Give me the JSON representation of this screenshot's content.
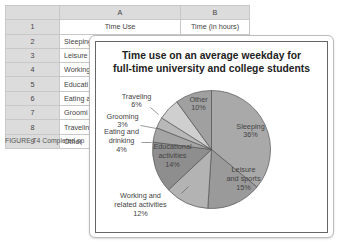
{
  "spreadsheet": {
    "column_headers": [
      "A",
      "B"
    ],
    "rows": [
      {
        "num": "1",
        "a": "Time Use",
        "b": "Time (in hours)"
      },
      {
        "num": "2",
        "a": "Sleeping",
        "b": "8.6"
      },
      {
        "num": "3",
        "a": "Leisure",
        "b": ""
      },
      {
        "num": "4",
        "a": "Working",
        "b": ""
      },
      {
        "num": "5",
        "a": "Educati",
        "b": ""
      },
      {
        "num": "6",
        "a": "Eating a",
        "b": ""
      },
      {
        "num": "7",
        "a": "Groomi",
        "b": ""
      },
      {
        "num": "8",
        "a": "Travelin",
        "b": ""
      },
      {
        "num": "9",
        "a": "Other",
        "b": ""
      }
    ]
  },
  "caption": "FIGURE T4 Completed sp",
  "chart_data": {
    "type": "pie",
    "title": "Time use on an average weekday for full-time university and college students",
    "title_lines": [
      "Time use on an average weekday for",
      "full-time university and college students"
    ],
    "categories": [
      "Sleeping",
      "Leisure and sports",
      "Working and related activities",
      "Educational activities",
      "Eating and drinking",
      "Grooming",
      "Traveling",
      "Other"
    ],
    "values": [
      36,
      15,
      12,
      14,
      4,
      3,
      6,
      10
    ],
    "unit": "%",
    "start_angle_deg": 0,
    "direction": "clockwise",
    "colors": [
      "#a9a9a9",
      "#9a9a9a",
      "#b3b3b3",
      "#8e8e8e",
      "#a5a5a5",
      "#b8b8b8",
      "#cfcfcf",
      "#a0a0a0"
    ],
    "labels": [
      {
        "lines": [
          "Sleeping",
          "36%"
        ]
      },
      {
        "lines": [
          "Leisure",
          "and sports",
          "15%"
        ]
      },
      {
        "lines": [
          "Working and",
          "related activities",
          "12%"
        ]
      },
      {
        "lines": [
          "Educational",
          "activities",
          "14%"
        ]
      },
      {
        "lines": [
          "Eating and",
          "drinking",
          "4%"
        ]
      },
      {
        "lines": [
          "Grooming",
          "3%"
        ]
      },
      {
        "lines": [
          "Traveling",
          "6%"
        ]
      },
      {
        "lines": [
          "Other",
          "10%"
        ]
      }
    ],
    "legend": "none (data labels)",
    "grid": false
  }
}
